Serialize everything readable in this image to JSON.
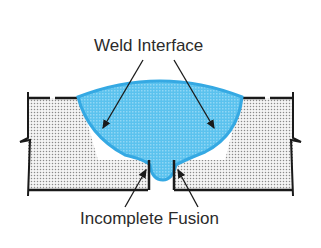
{
  "labels": {
    "top": "Weld Interface",
    "bottom": "Incomplete Fusion"
  },
  "colors": {
    "weld_fill": "#5bc2ee",
    "weld_outline": "#35a9e3",
    "base_metal_dots": "#8a8a8a",
    "outline": "#1a1a1a",
    "text": "#2b2b2b"
  }
}
